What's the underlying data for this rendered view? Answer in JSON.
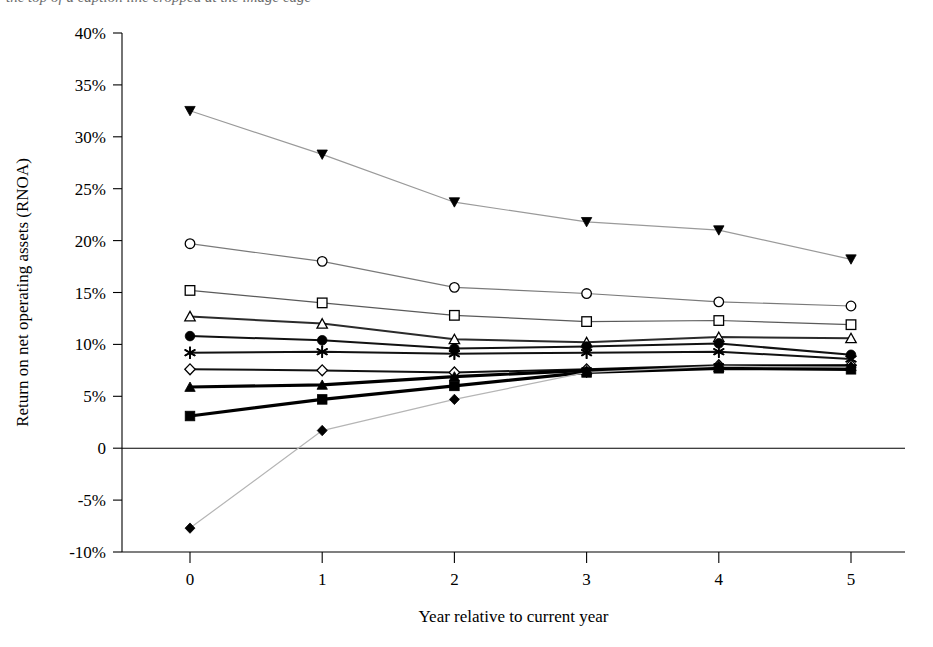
{
  "figure": {
    "top_cropped_text": "the top of a caption line cropped at the image edge",
    "plot_type": "line chart"
  },
  "axes": {
    "y_title": "Return on net operating assets (RNOA)",
    "x_title": "Year relative to current year",
    "y_ticks": [
      "40%",
      "35%",
      "30%",
      "25%",
      "20%",
      "15%",
      "10%",
      "5%",
      "0",
      "-5%",
      "-10%"
    ],
    "x_ticks": [
      "0",
      "1",
      "2",
      "3",
      "4",
      "5"
    ]
  },
  "chart_data": {
    "type": "line",
    "title": "",
    "xlabel": "Year relative to current year",
    "ylabel": "Return on net operating assets (RNOA)",
    "x": [
      0,
      1,
      2,
      3,
      4,
      5
    ],
    "xlim": [
      0,
      5
    ],
    "ylim": [
      -10,
      40
    ],
    "ytick_values": [
      40,
      35,
      30,
      25,
      20,
      15,
      10,
      5,
      0,
      -5,
      -10
    ],
    "ytick_labels": [
      "40%",
      "35%",
      "30%",
      "25%",
      "20%",
      "15%",
      "10%",
      "5%",
      "0",
      "-5%",
      "-10%"
    ],
    "y_unit": "percent",
    "grid": false,
    "legend": "none",
    "zero_reference_line": true,
    "series": [
      {
        "name": "portfolio-1",
        "marker": "filled-down-triangle",
        "color": "#9a9a9a",
        "line_weight": "thin",
        "values": [
          32.5,
          28.3,
          23.7,
          21.8,
          21.0,
          18.2
        ]
      },
      {
        "name": "portfolio-2",
        "marker": "open-circle",
        "color": "#7a7a7a",
        "line_weight": "thin",
        "values": [
          19.7,
          18.0,
          15.5,
          14.9,
          14.1,
          13.7
        ]
      },
      {
        "name": "portfolio-3",
        "marker": "open-square",
        "color": "#5a5a5a",
        "line_weight": "thin",
        "values": [
          15.2,
          14.0,
          12.8,
          12.2,
          12.3,
          11.9
        ]
      },
      {
        "name": "portfolio-4",
        "marker": "open-triangle",
        "color": "#2b2b2b",
        "line_weight": "medium",
        "values": [
          12.7,
          12.0,
          10.5,
          10.2,
          10.7,
          10.6
        ]
      },
      {
        "name": "portfolio-5",
        "marker": "filled-circle",
        "color": "#111111",
        "line_weight": "medium",
        "values": [
          10.8,
          10.4,
          9.6,
          9.8,
          10.1,
          9.0
        ]
      },
      {
        "name": "portfolio-6",
        "marker": "asterisk",
        "color": "#111111",
        "line_weight": "medium",
        "values": [
          9.2,
          9.3,
          9.1,
          9.2,
          9.3,
          8.6
        ]
      },
      {
        "name": "portfolio-7",
        "marker": "open-diamond",
        "color": "#111111",
        "line_weight": "medium",
        "values": [
          7.6,
          7.5,
          7.3,
          7.6,
          8.0,
          8.0
        ]
      },
      {
        "name": "portfolio-8",
        "marker": "filled-triangle",
        "color": "#000000",
        "line_weight": "thick",
        "values": [
          5.9,
          6.1,
          6.9,
          7.5,
          7.8,
          7.9
        ]
      },
      {
        "name": "portfolio-9",
        "marker": "filled-square",
        "color": "#000000",
        "line_weight": "thick",
        "values": [
          3.1,
          4.7,
          6.0,
          7.3,
          7.7,
          7.6
        ]
      },
      {
        "name": "portfolio-10",
        "marker": "filled-diamond",
        "color": "#b5b5b5",
        "line_weight": "thin",
        "values": [
          -7.7,
          1.7,
          4.7,
          7.3,
          7.9,
          7.8
        ]
      }
    ]
  }
}
